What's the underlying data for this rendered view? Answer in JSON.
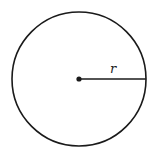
{
  "diagram": {
    "shape": "circle",
    "center": {
      "x": 79,
      "y": 79
    },
    "radius_px": 67,
    "radius_label": "r",
    "stroke_color": "#1a1a1a",
    "background": "#ffffff"
  }
}
